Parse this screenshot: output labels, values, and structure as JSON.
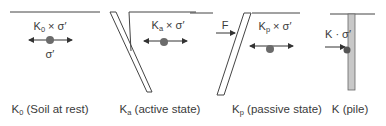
{
  "colors": {
    "line": "#444444",
    "dot": "#6b6b6b",
    "pile_fill": "#c8c8c8",
    "text": "#3a3a3a"
  },
  "panels": [
    {
      "id": "k0",
      "force_label": {
        "base": "K",
        "sub": "0",
        "rest": " × σ′"
      },
      "stress_label": "σ′",
      "caption": {
        "base": "K",
        "sub": "0",
        "rest": " (Soil at rest)"
      }
    },
    {
      "id": "ka",
      "force_label": {
        "base": "K",
        "sub": "a",
        "rest": " × σ′"
      },
      "caption": {
        "base": "K",
        "sub": "a",
        "rest": " (active state)"
      }
    },
    {
      "id": "kp",
      "applied_force": "F",
      "force_label": {
        "base": "K",
        "sub": "p",
        "rest": " × σ′"
      },
      "caption": {
        "base": "K",
        "sub": "p",
        "rest": " (passive state)"
      }
    },
    {
      "id": "k",
      "force_label": {
        "base": "K",
        "rest": " · σ′"
      },
      "caption": {
        "base": "K",
        "rest": " (pile)"
      }
    }
  ]
}
